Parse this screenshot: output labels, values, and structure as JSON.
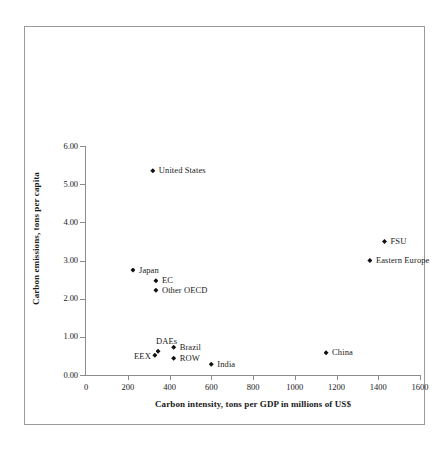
{
  "chart_data": {
    "type": "scatter",
    "title": "",
    "xlabel": "Carbon intensity, tons per GDP in millions of US$",
    "ylabel": "Carbon emissions, tons per capita",
    "xlim": [
      0,
      1600
    ],
    "ylim": [
      0.0,
      6.0
    ],
    "xticks": [
      0,
      200,
      400,
      600,
      800,
      1000,
      1200,
      1400,
      1600
    ],
    "xtick_labels": [
      "0",
      "200",
      "400",
      "600",
      "800",
      "1000",
      "1200",
      "1400",
      "1600"
    ],
    "yticks": [
      0.0,
      1.0,
      2.0,
      3.0,
      4.0,
      5.0,
      6.0
    ],
    "ytick_labels": [
      "0.00",
      "1.00",
      "2.00",
      "3.00",
      "4.00",
      "5.00",
      "6.00"
    ],
    "grid": false,
    "legend": "none",
    "marker": "diamond",
    "marker_color": "#111111",
    "points": [
      {
        "label": "United States",
        "x": 320,
        "y": 5.35,
        "label_pos": "right"
      },
      {
        "label": "FSU",
        "x": 1430,
        "y": 3.5,
        "label_pos": "right"
      },
      {
        "label": "Eastern Europe",
        "x": 1360,
        "y": 3.0,
        "label_pos": "right"
      },
      {
        "label": "Japan",
        "x": 225,
        "y": 2.75,
        "label_pos": "right"
      },
      {
        "label": "EC",
        "x": 335,
        "y": 2.47,
        "label_pos": "right"
      },
      {
        "label": "Other OECD",
        "x": 335,
        "y": 2.22,
        "label_pos": "right"
      },
      {
        "label": "Brazil",
        "x": 420,
        "y": 0.73,
        "label_pos": "right"
      },
      {
        "label": "DAEs",
        "x": 345,
        "y": 0.62,
        "label_pos": "above"
      },
      {
        "label": "EEX",
        "x": 330,
        "y": 0.52,
        "label_pos": "left"
      },
      {
        "label": "ROW",
        "x": 420,
        "y": 0.44,
        "label_pos": "right"
      },
      {
        "label": "China",
        "x": 1150,
        "y": 0.58,
        "label_pos": "right"
      },
      {
        "label": "India",
        "x": 600,
        "y": 0.28,
        "label_pos": "right"
      }
    ]
  },
  "colors": {
    "axis": "#8c8c8c",
    "frame": "#9a9a9a",
    "marker": "#111111",
    "text": "#1a1a1a",
    "background": "#ffffff"
  }
}
